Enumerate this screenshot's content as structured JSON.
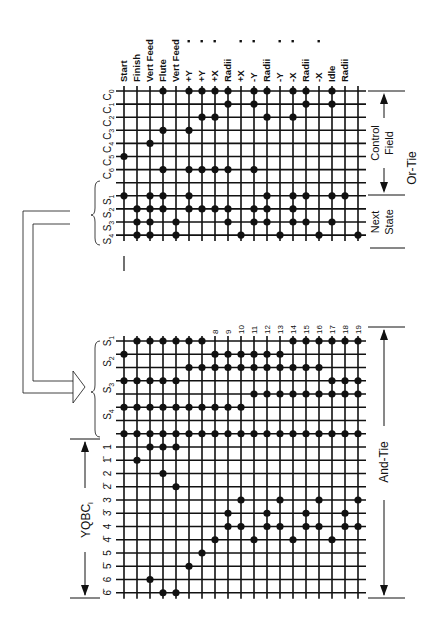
{
  "diagram": {
    "title_or_tie": "Or-Tie",
    "title_and_tie": "And-Tie",
    "control_field_label": [
      "Control",
      "Field"
    ],
    "next_state_label": [
      "Next",
      "State"
    ],
    "yqbc_label": "YQBC",
    "yqbc_subscript": "i",
    "columns": 19,
    "column_labels_top": [
      {
        "text": "Start",
        "dot": false
      },
      {
        "text": "Finish",
        "dot": false
      },
      {
        "text": "Vert Feed",
        "dot": false
      },
      {
        "text": "Flute",
        "dot": false
      },
      {
        "text": "Vert Feed",
        "dot": false
      },
      {
        "text": "+Y",
        "dot": true
      },
      {
        "text": "+Y",
        "dot": true
      },
      {
        "text": "+X",
        "dot": true
      },
      {
        "text": "Radii",
        "dot": false
      },
      {
        "text": "+X",
        "dot": true
      },
      {
        "text": "-Y",
        "dot": true
      },
      {
        "text": "Radii",
        "dot": false
      },
      {
        "text": "-Y",
        "dot": true
      },
      {
        "text": "-X",
        "dot": true
      },
      {
        "text": "Radii",
        "dot": false
      },
      {
        "text": "-X",
        "dot": true
      },
      {
        "text": "Idle",
        "dot": false
      },
      {
        "text": "Radii",
        "dot": false
      }
    ],
    "column_numbers_bottom": [
      "8",
      "9",
      "10",
      "11",
      "12",
      "13",
      "14",
      "15",
      "16",
      "17",
      "18",
      "19"
    ],
    "or_tie": {
      "rows": [
        {
          "label": "C0",
          "dots": [
            3,
            5,
            6,
            7,
            8,
            10,
            11,
            13,
            14,
            16
          ]
        },
        {
          "label": "C1",
          "dots": [
            8,
            10,
            14,
            16
          ]
        },
        {
          "label": "C2",
          "dots": [
            6,
            7,
            11,
            13
          ]
        },
        {
          "label": "C3",
          "dots": [
            3,
            5
          ]
        },
        {
          "label": "C4",
          "dots": [
            2
          ]
        },
        {
          "label": "C5",
          "dots": [
            0
          ]
        },
        {
          "label": "C6",
          "dots": [
            3,
            5,
            6,
            7,
            8,
            10
          ]
        },
        {
          "label": "",
          "dots": []
        },
        {
          "label": "S1",
          "dots": [
            0,
            2,
            3,
            5,
            11,
            13,
            14,
            16,
            17
          ]
        },
        {
          "label": "S2",
          "dots": [
            1,
            2,
            3,
            5,
            6,
            7,
            8,
            10,
            11,
            13
          ]
        },
        {
          "label": "S3",
          "dots": [
            1,
            2,
            4,
            8,
            10,
            11,
            13,
            14,
            16
          ]
        },
        {
          "label": "S4",
          "dots": [
            1,
            2,
            4,
            9,
            12,
            15,
            18
          ]
        }
      ]
    },
    "and_tie": {
      "rows": [
        {
          "label": "S1",
          "dots": [
            1,
            2,
            3,
            4,
            5,
            6,
            13,
            14,
            15,
            16,
            17,
            18
          ]
        },
        {
          "label": "",
          "dots": [
            0,
            7,
            8,
            9,
            10,
            11,
            12
          ]
        },
        {
          "label": "S2",
          "dots": [
            5,
            6,
            7,
            8,
            9,
            10,
            11,
            12,
            13,
            14,
            15
          ]
        },
        {
          "label": "",
          "dots": [
            0,
            1,
            2,
            3,
            4,
            16,
            17,
            18
          ]
        },
        {
          "label": "S3",
          "dots": [
            10,
            11,
            12,
            13,
            14,
            15,
            16,
            17,
            18
          ]
        },
        {
          "label": "",
          "dots": [
            0,
            1,
            2,
            3,
            4,
            5,
            6,
            7,
            8,
            9
          ]
        },
        {
          "label": "S4",
          "dots": []
        },
        {
          "label": "",
          "dots": [
            0,
            1,
            2,
            3,
            4,
            5,
            6,
            7,
            8,
            9,
            10,
            11,
            12,
            13,
            14,
            15,
            16,
            17,
            18
          ]
        },
        {
          "label": "1",
          "dots": [
            2,
            3,
            4
          ]
        },
        {
          "label": "1̄",
          "dots": [
            1
          ]
        },
        {
          "label": "2",
          "dots": [
            3
          ]
        },
        {
          "label": "2̄",
          "dots": [
            4
          ]
        },
        {
          "label": "3",
          "dots": [
            9,
            12,
            15,
            18
          ]
        },
        {
          "label": "3̄",
          "dots": [
            8,
            11,
            14,
            17
          ]
        },
        {
          "label": "4",
          "dots": [
            8,
            9,
            11,
            12,
            14,
            15,
            17,
            18
          ]
        },
        {
          "label": "4̄",
          "dots": [
            7,
            10,
            13,
            16
          ]
        },
        {
          "label": "5",
          "dots": [
            6
          ]
        },
        {
          "label": "5̄",
          "dots": [
            5
          ]
        },
        {
          "label": "6",
          "dots": [
            2
          ]
        },
        {
          "label": "6̄",
          "dots": [
            3,
            4
          ]
        }
      ]
    },
    "colors": {
      "ink": "#111111",
      "background": "#ffffff"
    }
  }
}
